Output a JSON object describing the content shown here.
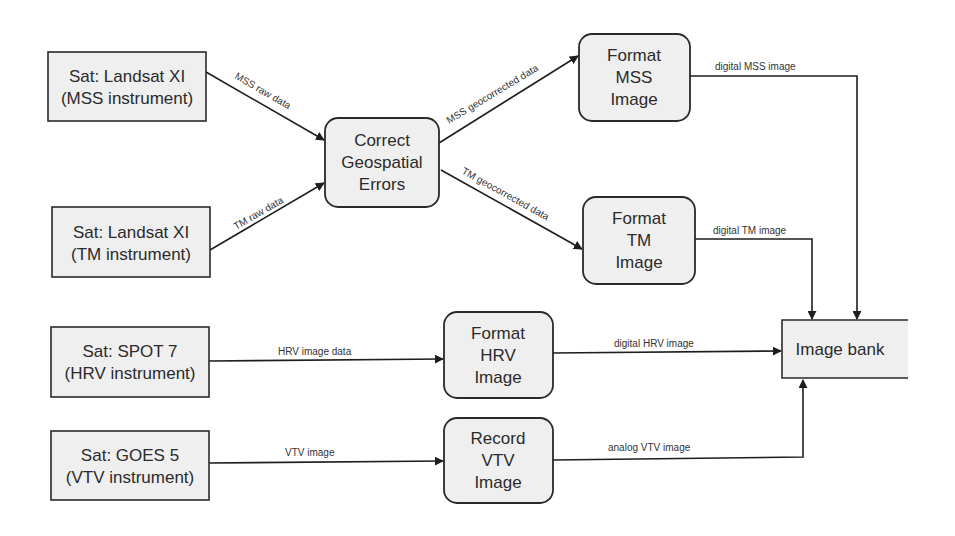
{
  "diagram": {
    "type": "data-flow-diagram",
    "sources": [
      {
        "id": "landsat_mss",
        "line1": "Sat: Landsat XI",
        "line2": "(MSS instrument)"
      },
      {
        "id": "landsat_tm",
        "line1": "Sat: Landsat XI",
        "line2": "(TM instrument)"
      },
      {
        "id": "spot7",
        "line1": "Sat: SPOT 7",
        "line2": "(HRV instrument)"
      },
      {
        "id": "goes5",
        "line1": "Sat: GOES 5",
        "line2": "(VTV  instrument)"
      }
    ],
    "processes": [
      {
        "id": "correct",
        "lines": [
          "Correct",
          "Geospatial",
          "Errors"
        ]
      },
      {
        "id": "format_mss",
        "lines": [
          "Format",
          "MSS",
          "Image"
        ]
      },
      {
        "id": "format_tm",
        "lines": [
          "Format",
          "TM",
          "Image"
        ]
      },
      {
        "id": "format_hrv",
        "lines": [
          "Format",
          "HRV",
          "Image"
        ]
      },
      {
        "id": "record_vtv",
        "lines": [
          "Record",
          "VTV",
          "Image"
        ]
      }
    ],
    "store": {
      "id": "image_bank",
      "label": "Image bank"
    },
    "flows": [
      {
        "from": "landsat_mss",
        "to": "correct",
        "label": "MSS raw data"
      },
      {
        "from": "landsat_tm",
        "to": "correct",
        "label": "TM raw data"
      },
      {
        "from": "correct",
        "to": "format_mss",
        "label": "MSS geocorrected data"
      },
      {
        "from": "correct",
        "to": "format_tm",
        "label": "TM geocorrected data"
      },
      {
        "from": "format_mss",
        "to": "image_bank",
        "label": "digital MSS image"
      },
      {
        "from": "format_tm",
        "to": "image_bank",
        "label": "digital TM image"
      },
      {
        "from": "spot7",
        "to": "format_hrv",
        "label": "HRV image data"
      },
      {
        "from": "format_hrv",
        "to": "image_bank",
        "label": "digital HRV image"
      },
      {
        "from": "goes5",
        "to": "record_vtv",
        "label": "VTV image"
      },
      {
        "from": "record_vtv",
        "to": "image_bank",
        "label": "analog VTV image"
      }
    ]
  }
}
